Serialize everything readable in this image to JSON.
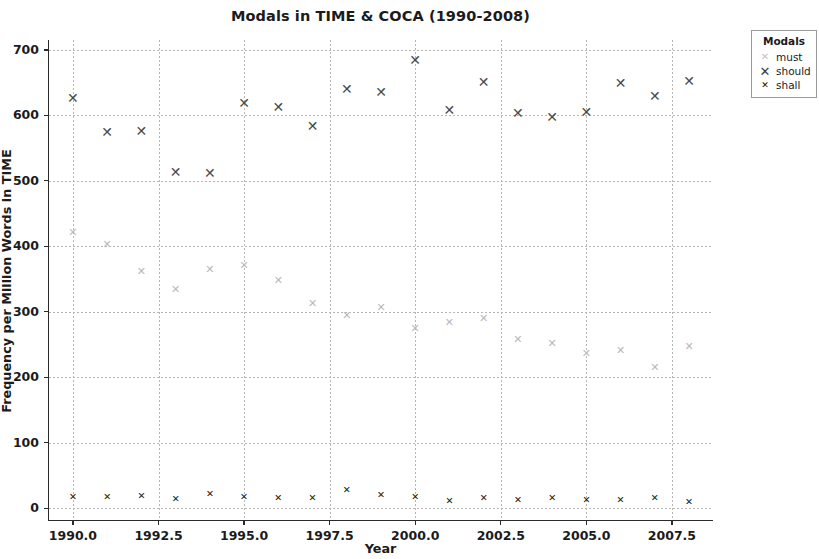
{
  "chart_data": {
    "type": "scatter",
    "title": "Modals in TIME & COCA (1990-2008)",
    "xlabel": "Year",
    "ylabel": "Frequency per Million Words in TIME",
    "xlim": [
      1989.3,
      2008.7
    ],
    "ylim": [
      -18,
      715
    ],
    "xticks": [
      "1990.0",
      "1992.5",
      "1995.0",
      "1997.5",
      "2000.0",
      "2002.5",
      "2005.0",
      "2007.5"
    ],
    "xtick_values": [
      1990.0,
      1992.5,
      1995.0,
      1997.5,
      2000.0,
      2002.5,
      2005.0,
      2007.5
    ],
    "yticks": [
      "0",
      "100",
      "200",
      "300",
      "400",
      "500",
      "600",
      "700"
    ],
    "ytick_values": [
      0,
      100,
      200,
      300,
      400,
      500,
      600,
      700
    ],
    "grid": true,
    "legend_position": "upper right outside",
    "legend_title": "Modals",
    "x": [
      1990,
      1991,
      1992,
      1993,
      1994,
      1995,
      1996,
      1997,
      1998,
      1999,
      2000,
      2001,
      2002,
      2003,
      2004,
      2005,
      2006,
      2007,
      2008
    ],
    "series": [
      {
        "name": "must",
        "marker": "x",
        "color": "#bcbcbc",
        "values": [
          422,
          403,
          363,
          335,
          365,
          372,
          348,
          314,
          295,
          307,
          275,
          285,
          291,
          258,
          253,
          237,
          241,
          216,
          248
        ]
      },
      {
        "name": "should",
        "marker": "x",
        "color": "#4a4a4a",
        "values": [
          626,
          574,
          576,
          514,
          512,
          619,
          612,
          584,
          640,
          635,
          684,
          608,
          651,
          604,
          598,
          605,
          649,
          630,
          653
        ]
      },
      {
        "name": "shall",
        "marker": "x",
        "color": "#1a1a1a",
        "values": [
          17,
          17,
          18,
          14,
          22,
          17,
          16,
          15,
          28,
          20,
          17,
          11,
          15,
          12,
          16,
          12,
          13,
          15,
          10
        ]
      }
    ]
  },
  "artifacts": [
    {
      "text": "",
      "x": 0,
      "y": 0
    }
  ]
}
